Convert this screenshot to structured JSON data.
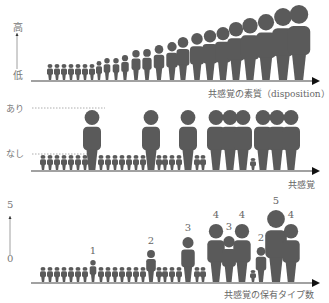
{
  "colors": {
    "figure": "#5a5a5a",
    "axis": "#444444",
    "dash": "#999999",
    "text": "#666666"
  },
  "panel1": {
    "y_top_label": "高",
    "y_bottom_label": "低",
    "x_label": "共感覚の素質（disposition）",
    "baseline": 80,
    "figures": [
      {
        "x": 50,
        "h": 16
      },
      {
        "x": 57,
        "h": 16
      },
      {
        "x": 64,
        "h": 16
      },
      {
        "x": 71,
        "h": 16
      },
      {
        "x": 78,
        "h": 16
      },
      {
        "x": 85,
        "h": 16
      },
      {
        "x": 92,
        "h": 16
      },
      {
        "x": 99,
        "h": 19
      },
      {
        "x": 107,
        "h": 22
      },
      {
        "x": 116,
        "h": 22
      },
      {
        "x": 125,
        "h": 25
      },
      {
        "x": 136,
        "h": 30
      },
      {
        "x": 147,
        "h": 31
      },
      {
        "x": 159,
        "h": 35
      },
      {
        "x": 172,
        "h": 38
      },
      {
        "x": 183,
        "h": 43
      },
      {
        "x": 197,
        "h": 47
      },
      {
        "x": 210,
        "h": 50
      },
      {
        "x": 223,
        "h": 53
      },
      {
        "x": 236,
        "h": 58
      },
      {
        "x": 250,
        "h": 62
      },
      {
        "x": 266,
        "h": 66
      },
      {
        "x": 283,
        "h": 72
      },
      {
        "x": 299,
        "h": 75
      }
    ]
  },
  "panel2": {
    "y_top_label": "あり",
    "y_bottom_label": "なし",
    "x_label": "共感覚",
    "baseline": 170,
    "figures": [
      {
        "x": 43,
        "h": 15
      },
      {
        "x": 50,
        "h": 15
      },
      {
        "x": 57,
        "h": 15
      },
      {
        "x": 64,
        "h": 15
      },
      {
        "x": 71,
        "h": 15
      },
      {
        "x": 78,
        "h": 15
      },
      {
        "x": 85,
        "h": 15
      },
      {
        "x": 92,
        "h": 60
      },
      {
        "x": 101,
        "h": 15
      },
      {
        "x": 108,
        "h": 15
      },
      {
        "x": 115,
        "h": 15
      },
      {
        "x": 122,
        "h": 15
      },
      {
        "x": 129,
        "h": 15
      },
      {
        "x": 136,
        "h": 15
      },
      {
        "x": 143,
        "h": 15
      },
      {
        "x": 151,
        "h": 60
      },
      {
        "x": 159,
        "h": 15
      },
      {
        "x": 165,
        "h": 15
      },
      {
        "x": 172,
        "h": 15
      },
      {
        "x": 179,
        "h": 15
      },
      {
        "x": 188,
        "h": 60
      },
      {
        "x": 197,
        "h": 15
      },
      {
        "x": 203,
        "h": 15
      },
      {
        "x": 216,
        "h": 60
      },
      {
        "x": 230,
        "h": 60
      },
      {
        "x": 243,
        "h": 60
      },
      {
        "x": 253,
        "h": 12
      },
      {
        "x": 263,
        "h": 60
      },
      {
        "x": 277,
        "h": 60
      },
      {
        "x": 291,
        "h": 60
      }
    ]
  },
  "panel3": {
    "y_top_label": "5",
    "y_bottom_label": "0",
    "x_label": "共感覚の保有タイプ数",
    "baseline": 282,
    "figures": [
      {
        "x": 43,
        "h": 15
      },
      {
        "x": 50,
        "h": 15
      },
      {
        "x": 57,
        "h": 15
      },
      {
        "x": 64,
        "h": 15
      },
      {
        "x": 71,
        "h": 15
      },
      {
        "x": 78,
        "h": 15
      },
      {
        "x": 85,
        "h": 15
      },
      {
        "x": 93,
        "h": 22,
        "n": "1"
      },
      {
        "x": 101,
        "h": 15
      },
      {
        "x": 108,
        "h": 15
      },
      {
        "x": 115,
        "h": 15
      },
      {
        "x": 122,
        "h": 15
      },
      {
        "x": 129,
        "h": 15
      },
      {
        "x": 136,
        "h": 15
      },
      {
        "x": 143,
        "h": 15
      },
      {
        "x": 151,
        "h": 32,
        "n": "2"
      },
      {
        "x": 159,
        "h": 15
      },
      {
        "x": 165,
        "h": 15
      },
      {
        "x": 172,
        "h": 15
      },
      {
        "x": 179,
        "h": 15
      },
      {
        "x": 188,
        "h": 45,
        "n": "3"
      },
      {
        "x": 197,
        "h": 15
      },
      {
        "x": 203,
        "h": 15
      },
      {
        "x": 216,
        "h": 58,
        "n": "4"
      },
      {
        "x": 229,
        "h": 46,
        "n": "3"
      },
      {
        "x": 242,
        "h": 58,
        "n": "4"
      },
      {
        "x": 253,
        "h": 12
      },
      {
        "x": 261,
        "h": 35,
        "n": "2"
      },
      {
        "x": 276,
        "h": 72,
        "n": "5"
      },
      {
        "x": 291,
        "h": 58,
        "n": "4"
      }
    ]
  }
}
